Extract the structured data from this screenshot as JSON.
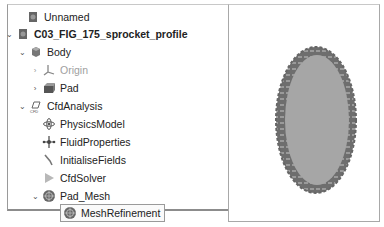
{
  "tree": {
    "items": [
      {
        "label": "Unnamed",
        "icon": "document-icon",
        "indent": 0,
        "arrow": "",
        "style": "normal"
      },
      {
        "label": "C03_FIG_175_sprocket_profile",
        "icon": "document-icon",
        "indent": 0,
        "arrow": "expanded",
        "style": "bold"
      },
      {
        "label": "Body",
        "icon": "body-icon",
        "indent": 1,
        "arrow": "expanded",
        "style": "normal"
      },
      {
        "label": "Origin",
        "icon": "origin-axes-icon",
        "indent": 2,
        "arrow": "collapsed",
        "style": "disabled"
      },
      {
        "label": "Pad",
        "icon": "pad-icon",
        "indent": 2,
        "arrow": "collapsed",
        "style": "normal"
      },
      {
        "label": "CfdAnalysis",
        "icon": "cfd-analysis-icon",
        "indent": 1,
        "arrow": "expanded",
        "style": "normal"
      },
      {
        "label": "PhysicsModel",
        "icon": "physics-model-icon",
        "indent": 2,
        "arrow": "",
        "style": "normal"
      },
      {
        "label": "FluidProperties",
        "icon": "fluid-properties-icon",
        "indent": 2,
        "arrow": "",
        "style": "normal"
      },
      {
        "label": "InitialiseFields",
        "icon": "initialise-fields-icon",
        "indent": 2,
        "arrow": "",
        "style": "normal"
      },
      {
        "label": "CfdSolver",
        "icon": "cfd-solver-icon",
        "indent": 2,
        "arrow": "",
        "style": "normal"
      },
      {
        "label": "Pad_Mesh",
        "icon": "mesh-icon",
        "indent": 2,
        "arrow": "expanded",
        "style": "normal"
      },
      {
        "label": "MeshRefinement",
        "icon": "mesh-refinement-icon",
        "indent": 3,
        "arrow": "",
        "style": "selected"
      }
    ]
  },
  "viewport": {
    "object": "sprocket-profile",
    "fill_color": "#a6a6a6",
    "teeth_color": "#6e6e6e"
  },
  "arrows": {
    "expanded": "⌄",
    "collapsed": "›"
  }
}
